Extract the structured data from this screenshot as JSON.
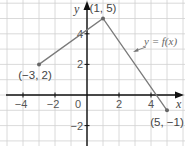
{
  "chart_data": {
    "type": "line",
    "title": "",
    "xlabel": "x",
    "ylabel": "y",
    "function_label": "y = f(x)",
    "xlim": [
      -5,
      6
    ],
    "ylim": [
      -3,
      6
    ],
    "grid": true,
    "x_ticks": [
      -4,
      -2,
      0,
      2,
      4
    ],
    "y_ticks": [
      -2,
      2,
      4
    ],
    "x_tick_labels": [
      "−4",
      "−2",
      "0",
      "2",
      "4"
    ],
    "y_tick_labels": [
      "−2",
      "2",
      "4"
    ],
    "series": [
      {
        "name": "y = f(x)",
        "x": [
          -3,
          1,
          5
        ],
        "y": [
          2,
          5,
          -1
        ]
      }
    ],
    "annotations": [
      {
        "text": "(−3, 2)",
        "x": -3,
        "y": 2
      },
      {
        "text": "(1, 5)",
        "x": 1,
        "y": 5
      },
      {
        "text": "(5, −1)",
        "x": 5,
        "y": -1
      }
    ],
    "colors": {
      "line": "#7a7a7a",
      "grid": "#d0d0d0",
      "axis": "#111111",
      "point": "#666666"
    }
  }
}
